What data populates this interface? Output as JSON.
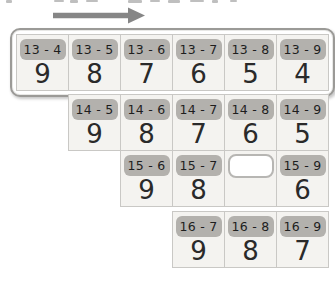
{
  "worksheet": {
    "description_arrow": "right-arrow",
    "colors": {
      "card_bg": "#f4f3f0",
      "card_border": "#c9c8c5",
      "chip_bg": "#b3b1ad",
      "highlight_border": "#9b9a97",
      "arrow": "#868686",
      "text": "#2a2a2a"
    },
    "rows": [
      {
        "family": "13",
        "start_column": 1,
        "highlighted": true,
        "cards": [
          {
            "label": "13 - 4",
            "answer": "9"
          },
          {
            "label": "13 - 5",
            "answer": "8"
          },
          {
            "label": "13 - 6",
            "answer": "7"
          },
          {
            "label": "13 - 7",
            "answer": "6"
          },
          {
            "label": "13 - 8",
            "answer": "5"
          },
          {
            "label": "13 - 9",
            "answer": "4"
          }
        ]
      },
      {
        "family": "14",
        "start_column": 2,
        "highlighted": false,
        "cards": [
          {
            "label": "14 - 5",
            "answer": "9"
          },
          {
            "label": "14 - 6",
            "answer": "8"
          },
          {
            "label": "14 - 7",
            "answer": "7"
          },
          {
            "label": "14 - 8",
            "answer": "6"
          },
          {
            "label": "14 - 9",
            "answer": "5"
          }
        ]
      },
      {
        "family": "15",
        "start_column": 3,
        "highlighted": false,
        "cards": [
          {
            "label": "15 - 6",
            "answer": "9"
          },
          {
            "label": "15 - 7",
            "answer": "8"
          },
          {
            "label": "",
            "answer": "",
            "blank": true
          },
          {
            "label": "15 - 9",
            "answer": "6"
          }
        ]
      },
      {
        "family": "16",
        "start_column": 4,
        "highlighted": false,
        "cards": [
          {
            "label": "16 - 7",
            "answer": "9"
          },
          {
            "label": "16 - 8",
            "answer": "8"
          },
          {
            "label": "16 - 9",
            "answer": "7"
          }
        ]
      }
    ]
  }
}
